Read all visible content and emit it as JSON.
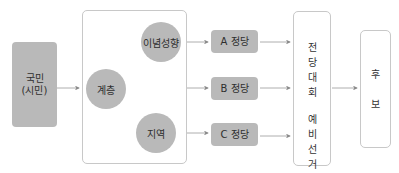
{
  "diagram": {
    "citizen": {
      "line1": "국민",
      "line2": "(시민)"
    },
    "factors": {
      "ideology": "이념성향",
      "class": "계층",
      "region": "지역"
    },
    "parties": [
      "A 정당",
      "B 정당",
      "C 정당"
    ],
    "convention": {
      "top": [
        "전",
        "당",
        "대",
        "회"
      ],
      "bottom": [
        "예",
        "비",
        "선",
        "거"
      ]
    },
    "candidate": [
      "후",
      "보"
    ],
    "colors": {
      "fill": "#b9b9b9",
      "border": "#c8c8c8",
      "arrow": "#8a8a8a"
    }
  }
}
